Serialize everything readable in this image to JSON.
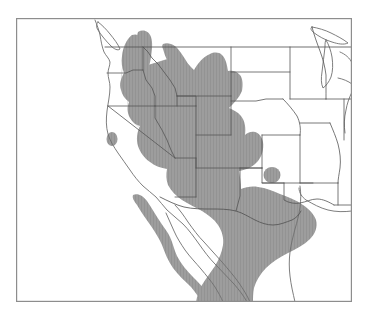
{
  "figure": {
    "kind": "species-distribution-map",
    "caption_remnant": "",
    "region_label": "Western North America",
    "background_color": "#ffffff",
    "frame": {
      "color": "#8d8d8d",
      "stroke_width": 1.2,
      "x": 16,
      "y": 18,
      "width": 336,
      "height": 284
    },
    "legend": {
      "present": false,
      "range_label": "Distribution range",
      "range_color": "#9a9a9a"
    },
    "styles": {
      "range_fill": "#9a9a9a",
      "range_fill_light": "#a6a6a6",
      "hatch_color": "#8f8f8f",
      "coastline_color": "#6f6f6f",
      "coastline_width": 0.9,
      "state_border_color": "#555555",
      "state_border_width": 0.85,
      "land_fill": "#ffffff",
      "water_fill": "#ffffff"
    },
    "features": {
      "states_outlined": [
        "Washington",
        "Oregon",
        "California",
        "Idaho",
        "Nevada",
        "Montana",
        "Wyoming",
        "Utah",
        "Arizona",
        "Colorado",
        "New Mexico",
        "North Dakota",
        "South Dakota",
        "Nebraska",
        "Kansas",
        "Oklahoma",
        "Texas",
        "Minnesota",
        "Iowa",
        "Missouri",
        "Arkansas",
        "Louisiana",
        "Wisconsin",
        "Illinois",
        "Michigan",
        "Indiana",
        "Kentucky",
        "Tennessee",
        "Mississippi"
      ],
      "countries_shown": [
        "United States",
        "Mexico",
        "Canada"
      ],
      "water_bodies": [
        "Gulf of California",
        "Great Lakes",
        "Puget Sound"
      ],
      "landforms": [
        "Vancouver Island",
        "Baja California Peninsula"
      ]
    },
    "range_notes": {
      "main_block": "Great Basin, Intermountain West and Sonoran/Chihuahuan deserts",
      "northern_limit": "southern interior British Columbia / eastern Washington",
      "eastern_limit": "Front Range of Colorado and Texas Trans-Pecos",
      "southern_limit": "central mainland Mexico",
      "disjunct_patches": [
        "northern California coast range",
        "southeastern Wyoming",
        "Oklahoma panhandle"
      ],
      "excluded_areas": [
        "Pacific coastal strip of California",
        "Great Plains east of the Rockies",
        "Gulf of California"
      ]
    }
  }
}
